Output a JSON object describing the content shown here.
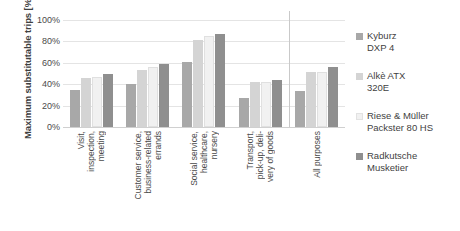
{
  "chart_data": {
    "type": "bar",
    "title": "",
    "subtitle": "",
    "xlabel": "",
    "ylabel": "Maximum substitutable trips [%]",
    "ylim": [
      0,
      100
    ],
    "ytick_labels": [
      "100%",
      "80%",
      "60%",
      "40%",
      "20%",
      "0%"
    ],
    "ytick_values": [
      100,
      80,
      60,
      40,
      20,
      0
    ],
    "grid": true,
    "legend_position": "right",
    "categories": [
      "Visit, inspection, meeting",
      "Customer service, business-related errands",
      "Social service, healthcare, nursery",
      "Transport, pick-up, delivery of goods",
      "All purposes"
    ],
    "category_label_lines": [
      [
        "Visit,",
        "inspection,",
        "meeting"
      ],
      [
        "Customer service,",
        "business-related",
        "errands"
      ],
      [
        "Social service,",
        "healthcare,",
        "nursery"
      ],
      [
        "Transport,",
        "pick-up, deli-",
        "very of goods"
      ],
      [
        "All purposes"
      ]
    ],
    "series": [
      {
        "name": "Kyburz DXP 4",
        "name_lines": [
          "Kyburz",
          "DXP 4"
        ],
        "color": "#a8a8a8",
        "values": [
          35,
          40,
          61,
          27,
          34
        ]
      },
      {
        "name": "Alkè ATX 320E",
        "name_lines": [
          "Alkè ATX",
          "320E"
        ],
        "color": "#d4d4d4",
        "values": [
          46,
          53,
          81,
          42,
          51
        ]
      },
      {
        "name": "Riese & Müller Packster 80 HS",
        "name_lines": [
          "Riese & Müller",
          "Packster 80 HS"
        ],
        "color": "#f1f1f1",
        "values": [
          47,
          56,
          85,
          42,
          51
        ]
      },
      {
        "name": "Radkutsche Musketier",
        "name_lines": [
          "Radkutsche",
          "Musketier"
        ],
        "color": "#8f8f8f",
        "values": [
          50,
          59,
          87,
          44,
          56
        ]
      }
    ]
  }
}
